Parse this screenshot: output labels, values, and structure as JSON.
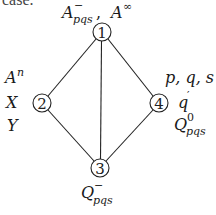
{
  "fragment_text": "case.",
  "diagram": {
    "nodes": [
      {
        "id": "1",
        "label": "1",
        "x": 102,
        "y": 32
      },
      {
        "id": "2",
        "label": "2",
        "x": 42,
        "y": 103
      },
      {
        "id": "3",
        "label": "3",
        "x": 100,
        "y": 168
      },
      {
        "id": "4",
        "label": "4",
        "x": 159,
        "y": 103
      }
    ],
    "edges": [
      [
        "1",
        "2"
      ],
      [
        "1",
        "4"
      ],
      [
        "1",
        "3"
      ],
      [
        "2",
        "3"
      ],
      [
        "4",
        "3"
      ]
    ],
    "labels": {
      "node1": {
        "a_base": "A",
        "a_sup": "−",
        "a_sub": "pqs",
        "comma": ",",
        "b_base": "A",
        "b_sup": "∞"
      },
      "node2": {
        "line1_base": "A",
        "line1_sup": "n",
        "line2": "X",
        "line3": "Y"
      },
      "node4": {
        "line1": "p, q, s",
        "line2_base": "q",
        "line2_sup": "′",
        "line3_base": "Q",
        "line3_sup": "0",
        "line3_sub": "pqs"
      },
      "node3": {
        "base": "Q",
        "sup": "−",
        "sub": "pqs"
      }
    }
  }
}
